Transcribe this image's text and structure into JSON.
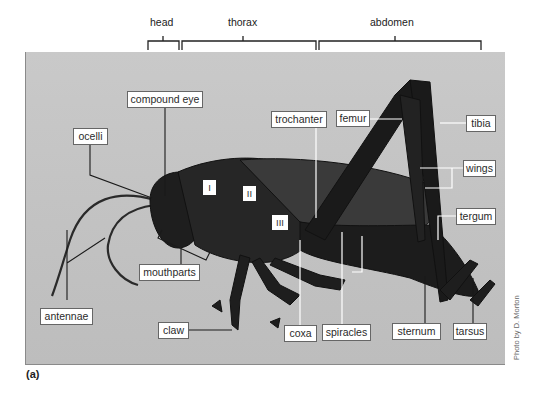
{
  "figure": {
    "caption": "(a)",
    "credit": "Photo by D. Morton"
  },
  "regions": [
    {
      "id": "head",
      "label": "head"
    },
    {
      "id": "thorax",
      "label": "thorax"
    },
    {
      "id": "abdomen",
      "label": "abdomen"
    }
  ],
  "thorax_segments": [
    "I",
    "II",
    "III"
  ],
  "labels": {
    "compound_eye": "compound eye",
    "ocelli": "ocelli",
    "antennae": "antennae",
    "mouthparts": "mouthparts",
    "claw": "claw",
    "coxa": "coxa",
    "spiracles": "spiracles",
    "sternum": "sternum",
    "tarsus": "tarsus",
    "trochanter": "trochanter",
    "femur": "femur",
    "tibia": "tibia",
    "wings": "wings",
    "tergum": "tergum"
  },
  "colors": {
    "background": "#c6c6c6",
    "insect": "#1c1c1c",
    "label_border": "#666666",
    "leader_dark": "#1a1a1a",
    "leader_light": "#ffffff"
  }
}
